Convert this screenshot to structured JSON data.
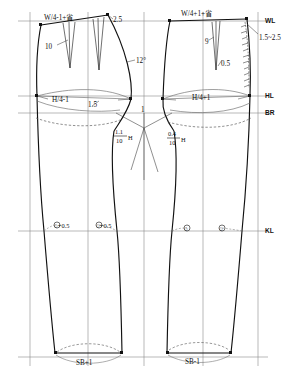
{
  "diagram": {
    "colors": {
      "outline": "#111111",
      "construction": "#6b6b6b",
      "dashed": "#555555",
      "paper": "#ffffff"
    },
    "guide_labels": [
      {
        "name": "waist-line",
        "text": "WL",
        "y": 21
      },
      {
        "name": "hip-line",
        "text": "HL",
        "y": 96
      },
      {
        "name": "crotch-line",
        "text": "BR",
        "y": 113
      },
      {
        "name": "knee-line",
        "text": "KL",
        "y": 231
      }
    ],
    "left_block": {
      "name": "back-block",
      "waist_label": "W/4-1+省",
      "hip_label": "H/4-1",
      "hem_label": "SB+1",
      "dart_depth": "10",
      "top_rise": "2.5",
      "angle": "12°",
      "seat_offset": "1.5",
      "knee_labels": [
        "○+0.5",
        "○+0.5"
      ],
      "crotch_fraction": {
        "numerator": "1.1",
        "denominator": "10",
        "suffix": "H"
      }
    },
    "right_block": {
      "name": "front-block",
      "waist_label": "W/4+1+省",
      "hip_label": "H/4+1",
      "hem_label": "SB-1",
      "dart_depth": "9",
      "dart_offset": "0.5",
      "fly_width": "1.5~2.5",
      "knee_labels": [
        "○",
        "○"
      ],
      "crotch_fraction": {
        "numerator": "0.4",
        "denominator": "10",
        "suffix": "H"
      }
    },
    "center_label": "1"
  }
}
